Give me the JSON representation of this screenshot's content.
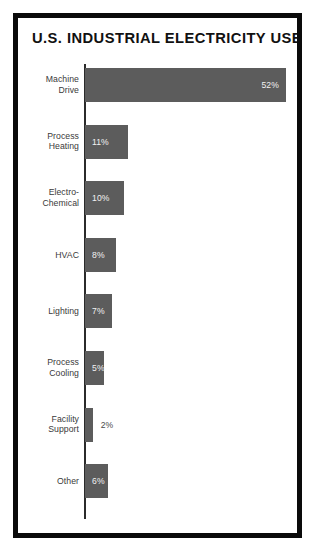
{
  "chart_data": {
    "type": "bar",
    "orientation": "horizontal",
    "title": "U.S. INDUSTRIAL ELECTRICITY USE",
    "xlabel": "",
    "ylabel": "",
    "unit": "%",
    "grid": false,
    "legend": "none",
    "axis_visible": true,
    "xlim": [
      0,
      52
    ],
    "categories": [
      "Machine Drive",
      "Process Heating",
      "Electro-Chemical",
      "HVAC",
      "Lighting",
      "Process Cooling",
      "Facility Support",
      "Other"
    ],
    "values": [
      52,
      11,
      10,
      8,
      7,
      5,
      2,
      6
    ],
    "value_labels": [
      "52%",
      "11%",
      "10%",
      "8%",
      "7%",
      "5%",
      "2%",
      "6%"
    ],
    "colors": {
      "bar": "#5c5c5c",
      "axis": "#2b2b2b",
      "frame": "#0a0a0a",
      "background": "#ffffff",
      "label_text": "#3a3a3a",
      "value_text_inside": "#f2f2f2",
      "value_text_outside": "#4a4a4a"
    }
  },
  "rows": [
    {
      "label_line1": "Machine",
      "label_line2": "Drive",
      "value": "52%",
      "pct": 52,
      "label_pos": "inside-right"
    },
    {
      "label_line1": "Process",
      "label_line2": "Heating",
      "value": "11%",
      "pct": 11,
      "label_pos": "inside-left"
    },
    {
      "label_line1": "Electro-",
      "label_line2": "Chemical",
      "value": "10%",
      "pct": 10,
      "label_pos": "inside-left"
    },
    {
      "label_line1": "HVAC",
      "label_line2": "",
      "value": "8%",
      "pct": 8,
      "label_pos": "inside-left"
    },
    {
      "label_line1": "Lighting",
      "label_line2": "",
      "value": "7%",
      "pct": 7,
      "label_pos": "inside-left"
    },
    {
      "label_line1": "Process",
      "label_line2": "Cooling",
      "value": "5%",
      "pct": 5,
      "label_pos": "inside-left"
    },
    {
      "label_line1": "Facility",
      "label_line2": "Support",
      "value": "2%",
      "pct": 2,
      "label_pos": "outside"
    },
    {
      "label_line1": "Other",
      "label_line2": "",
      "value": "6%",
      "pct": 6,
      "label_pos": "inside-left"
    }
  ]
}
